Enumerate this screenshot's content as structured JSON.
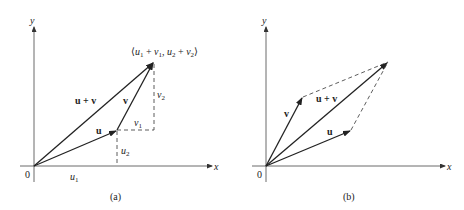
{
  "panels": [
    {
      "id": "a",
      "caption": "(a)",
      "axes": {
        "x": "x",
        "y": "y",
        "origin": "0"
      },
      "vectors": {
        "u": "u",
        "v": "v",
        "sum": "u + v"
      },
      "components": {
        "u1": "u",
        "u1_sub": "1",
        "u2": "u",
        "u2_sub": "2",
        "v1": "v",
        "v1_sub": "1",
        "v2": "v",
        "v2_sub": "2"
      },
      "tip_label": {
        "open": "⟨",
        "p1": "u",
        "s1": "1",
        "plus1": " + ",
        "p2": "v",
        "s2": "1",
        "comma": ", ",
        "p3": "u",
        "s3": "2",
        "plus2": " + ",
        "p4": "v",
        "s4": "2",
        "close": "⟩"
      }
    },
    {
      "id": "b",
      "caption": "(b)",
      "axes": {
        "x": "x",
        "y": "y",
        "origin": "0"
      },
      "vectors": {
        "u": "u",
        "v": "v",
        "sum": "u + v"
      }
    }
  ],
  "colors": {
    "stroke": "#222222",
    "dash": "#333333",
    "background": "#ffffff"
  }
}
